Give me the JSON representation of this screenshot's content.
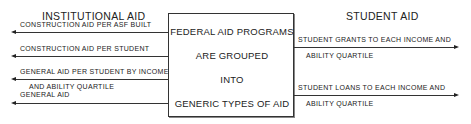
{
  "diagram": {
    "left_header": "INSTITUTIONAL AID",
    "right_header": "STUDENT AID",
    "center_box": {
      "lines": [
        "FEDERAL AID PROGRAMS",
        "ARE GROUPED",
        "INTO",
        "GENERIC TYPES OF AID"
      ]
    },
    "left_outputs": [
      {
        "line1": "CONSTRUCTION AID PER ASF BUILT",
        "line2": ""
      },
      {
        "line1": "CONSTRUCTION AID PER STUDENT",
        "line2": ""
      },
      {
        "line1": "GENERAL AID PER STUDENT BY INCOME",
        "line2": "AND ABILITY QUARTILE"
      },
      {
        "line1": "GENERAL AID",
        "line2": ""
      }
    ],
    "right_outputs": [
      {
        "line1": "STUDENT GRANTS TO EACH INCOME AND",
        "line2": "ABILITY QUARTILE"
      },
      {
        "line1": "STUDENT LOANS TO EACH INCOME AND",
        "line2": "ABILITY QUARTILE"
      }
    ]
  }
}
